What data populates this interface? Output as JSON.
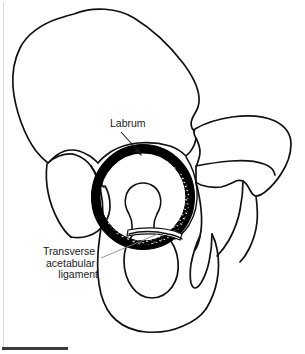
{
  "figure": {
    "background_color": "#ffffff",
    "ink_color": "#111111",
    "leader_color": "#8a8a8a",
    "width": 305,
    "height": 354
  },
  "labels": {
    "labrum": {
      "text": "Labrum",
      "pointer_type": "arrow"
    },
    "transverse_ligament": {
      "line1": "Transverse",
      "line2": "acetabular",
      "line3": "ligament",
      "pointer_type": "leader-line"
    }
  },
  "structures": {
    "ilium": "ilium-outline",
    "sacrum": "sacrum-outline",
    "ischium": "ischium-outline",
    "pubis": "pubis-outline",
    "obturator_foramen": "obturator-foramen",
    "acetabular_fossa": "acetabular-fossa",
    "labrum_ring": "labrum-ring",
    "transverse_acetabular_ligament": "transverse-acetabular-ligament",
    "greater_sciatic_notch": "greater-sciatic-notch",
    "ischial_spine": "ischial-spine"
  },
  "artifacts": {
    "scale_bar": "scale-bar",
    "scan_edge": "scan-edge-line"
  }
}
